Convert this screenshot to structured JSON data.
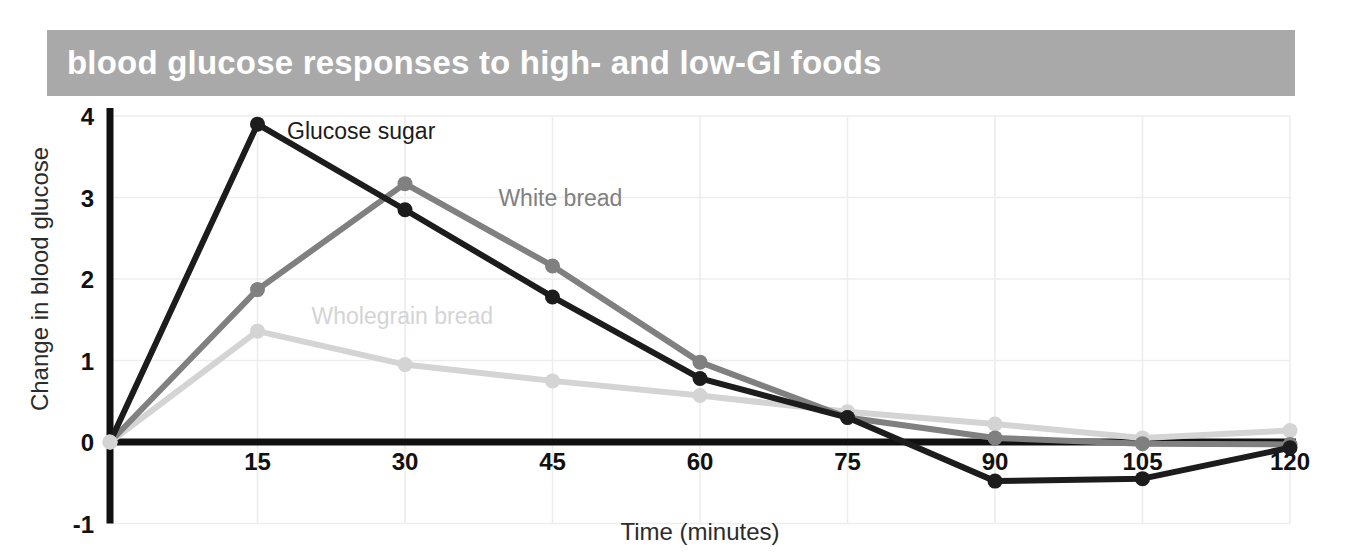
{
  "title": "blood glucose responses to high- and low-GI foods",
  "title_bar_color": "#a9a9a9",
  "title_text_color": "#ffffff",
  "background_color": "#ffffff",
  "axis_color": "#111111",
  "gridline_color": "#ededed",
  "chart_data": {
    "type": "line",
    "title": "blood glucose responses to high- and low-GI foods",
    "xlabel": "Time (minutes)",
    "ylabel": "Change in blood glucose",
    "x": [
      0,
      15,
      30,
      45,
      60,
      75,
      90,
      105,
      120
    ],
    "xtick_labels": [
      "15",
      "30",
      "45",
      "60",
      "75",
      "90",
      "105",
      "120"
    ],
    "xticks": [
      15,
      30,
      45,
      60,
      75,
      90,
      105,
      120
    ],
    "ytick_labels": [
      "4",
      "3",
      "2",
      "1",
      "0",
      "-1"
    ],
    "yticks": [
      4,
      3,
      2,
      1,
      0,
      -1
    ],
    "xlim": [
      0,
      120
    ],
    "ylim": [
      -1,
      4
    ],
    "grid": true,
    "legend_position": "inline-annotations",
    "series": [
      {
        "name": "Glucose sugar",
        "color": "#1c1c1c",
        "values": [
          0,
          3.9,
          2.85,
          1.78,
          0.78,
          0.3,
          -0.48,
          -0.45,
          -0.07
        ],
        "label_x": 18,
        "label_y": 3.72
      },
      {
        "name": "White bread",
        "color": "#808080",
        "values": [
          0,
          1.87,
          3.17,
          2.16,
          0.98,
          0.3,
          0.05,
          -0.02,
          -0.03
        ],
        "label_x": 39.5,
        "label_y": 2.9
      },
      {
        "name": "Wholegrain bread",
        "color": "#d4d4d4",
        "values": [
          0,
          1.36,
          0.95,
          0.75,
          0.57,
          0.37,
          0.22,
          0.05,
          0.14
        ],
        "label_x": 20.5,
        "label_y": 1.45
      }
    ]
  }
}
